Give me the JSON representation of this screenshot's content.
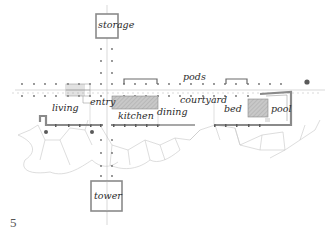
{
  "figure": {
    "number": "5",
    "type": "architectural site plan"
  },
  "rooms": {
    "storage": "storage",
    "pods": "pods",
    "living": "living",
    "entry": "entry",
    "kitchen": "kitchen",
    "dining": "dining",
    "courtyard": "courtyard",
    "bed": "bed",
    "pool": "pool",
    "tower": "tower"
  },
  "colors": {
    "line": "#8a8a8a",
    "wall": "#9a9a9a",
    "hatch": "#bdbdbd",
    "rock": "#c4c4c4",
    "column": "#6a6a6a",
    "tree": "#5a5a5a"
  }
}
